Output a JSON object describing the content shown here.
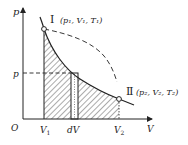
{
  "diagram": {
    "type": "p-V diagram (adiabatic expansion with work shaded)",
    "axes": {
      "y_label": "p",
      "x_label": "V",
      "origin_label": "O"
    },
    "x_ticks": [
      "V1",
      "dV",
      "V2"
    ],
    "y_ticks": [
      "p"
    ],
    "states": [
      {
        "id": "I",
        "label": "I",
        "params": "(p1, V1, T1)"
      },
      {
        "id": "II",
        "label": "II",
        "params": "(p2, V2, T2)"
      }
    ],
    "curves": [
      {
        "name": "adiabat",
        "style": "solid",
        "from": "I",
        "to": "II"
      },
      {
        "name": "isotherm",
        "style": "dashed",
        "from": "I"
      }
    ],
    "shaded_region": "area under adiabat from V1 to V2",
    "strip": "dV",
    "colors": {
      "line": "#222222",
      "background": "#ffffff"
    }
  },
  "labels": {
    "p_axis": "p",
    "v_axis": "V",
    "origin": "O",
    "v1": "V",
    "v1_sub": "1",
    "dv": "dV",
    "v2": "V",
    "v2_sub": "2",
    "p_tick": "p",
    "state1_roman": "Ⅰ",
    "state1_params": "(p₁, V₁, T₁)",
    "state2_roman": "Ⅱ",
    "state2_params": "(p₂, V₂, T₂)"
  }
}
